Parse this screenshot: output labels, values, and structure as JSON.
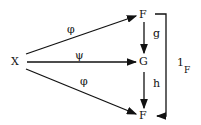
{
  "diagram": {
    "nodes": {
      "x": "X",
      "f_top": "F",
      "g": "G",
      "f_bottom": "F"
    },
    "arrows": {
      "x_to_f_top": "φ",
      "x_to_g": "ψ",
      "x_to_f_bottom": "φ",
      "f_to_g": "g",
      "g_to_f": "h",
      "identity_main": "1",
      "identity_sub": "F"
    }
  }
}
